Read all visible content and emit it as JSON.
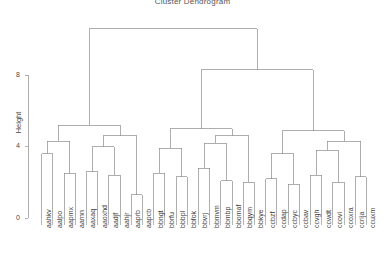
{
  "chart_data": {
    "type": "dendrogram",
    "title": "Cluster Dendrogram",
    "xlabel": "",
    "ylabel": "Height",
    "ylim": [
      0,
      11.2
    ],
    "yticks": [
      0,
      4,
      8
    ],
    "ytick_labels": [
      "0",
      "4",
      "8"
    ],
    "grid": false,
    "legend": null,
    "leaf_labels": [
      "aahkv",
      "aalpo",
      "aapmx",
      "aarnn",
      "aaxaq",
      "aaoxhd",
      "aadjf",
      "aahjr",
      "aaprb",
      "aapcb",
      "bbngt",
      "bbrfu",
      "bbbpl",
      "bbfok",
      "bbvrj",
      "bbmvm",
      "bbmbp",
      "bbomaf",
      "bbqym",
      "bbkye",
      "ccbzf",
      "ccdap",
      "ccbyc",
      "ccbav",
      "ccvgh",
      "ccwdt",
      "ccovi",
      "ccoxra",
      "ccrija",
      "ccuxm"
    ],
    "leaf_count": 30,
    "merges": [
      {
        "left": "aahkv",
        "right": "aalpo",
        "height": 3.6
      },
      {
        "left": "aapmx",
        "right": "aarnn",
        "height": 2.5
      },
      {
        "left": "aaxaq",
        "right": "aaoxhd",
        "height": 2.6
      },
      {
        "left": "aadjf",
        "right": "aahjr",
        "height": 2.4
      },
      {
        "left": "aaprb",
        "right": "aapcb",
        "height": 1.3
      },
      {
        "left": "bbngt",
        "right": "bbrfu",
        "height": 2.5
      },
      {
        "left": "bbbpl",
        "right": "bbfok",
        "height": 2.3
      },
      {
        "left": "bbvrj",
        "right": "bbmvm",
        "height": 2.8
      },
      {
        "left": "bbmbp",
        "right": "bbomaf",
        "height": 2.1
      },
      {
        "left": "bbqym",
        "right": "bbkye",
        "height": 2.0
      },
      {
        "left": "ccbzf",
        "right": "ccdap",
        "height": 2.2
      },
      {
        "left": "ccbyc",
        "right": "ccbav",
        "height": 1.9
      },
      {
        "left": "ccvgh",
        "right": "ccwdt",
        "height": 2.4
      },
      {
        "left": "ccovi",
        "right": "ccoxra",
        "height": 2.0
      },
      {
        "left": "ccrija",
        "right": "ccuxm",
        "height": 2.3
      },
      {
        "left": "cluster-a-1",
        "right": "cluster-a-2",
        "height": 5.2
      },
      {
        "left": "cluster-b-1",
        "right": "cluster-b-2",
        "height": 5.0
      },
      {
        "left": "cluster-c-1",
        "right": "cluster-c-2",
        "height": 4.9
      },
      {
        "left": "cluster-b",
        "right": "cluster-c",
        "height": 8.3
      },
      {
        "left": "cluster-a",
        "right": "cluster-bc",
        "height": 10.6
      }
    ],
    "axis_color": "#9a9a9a",
    "link_color": "#8c8c8c"
  }
}
